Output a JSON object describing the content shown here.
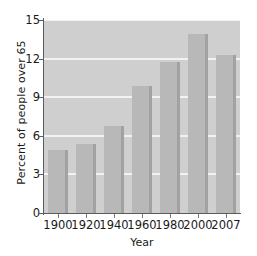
{
  "chart_data": {
    "type": "bar",
    "title": "",
    "xlabel": "Year",
    "ylabel": "Percent of people over 65",
    "categories": [
      "1900",
      "1920",
      "1940",
      "1960",
      "1980",
      "2000",
      "2007"
    ],
    "values": [
      4.9,
      5.4,
      6.8,
      9.9,
      11.7,
      13.9,
      12.3
    ],
    "ylim": [
      0,
      15
    ],
    "yticks": [
      0,
      3,
      6,
      9,
      12,
      15
    ],
    "ytick_labels": [
      "0",
      "3",
      "6",
      "9",
      "12",
      "15"
    ],
    "grid": true,
    "grid_axis": "y",
    "legend": false,
    "legend_position": "none",
    "colors": {
      "bar_face": "#b8b8b8",
      "bar_edge": "#a2a2a2",
      "plot_background": "#cfcfcf",
      "gridline": "#f2f2f2",
      "axis": "#5c5c5c",
      "text": "#1a1a1a",
      "figure_background": "#ffffff"
    }
  }
}
